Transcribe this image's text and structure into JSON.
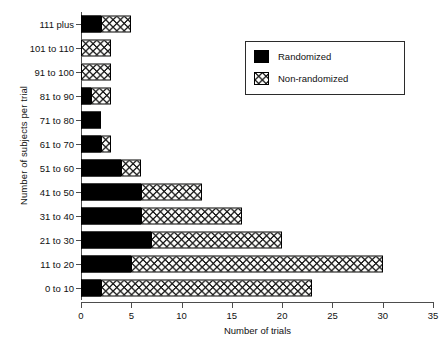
{
  "chart_data": {
    "type": "bar",
    "orientation": "horizontal",
    "stacked": true,
    "title": "",
    "xlabel": "Number of trials",
    "ylabel": "Number of subjects per trial",
    "xlim": [
      0,
      35
    ],
    "xticks": [
      0,
      5,
      10,
      15,
      20,
      25,
      30,
      35
    ],
    "xticklabels": [
      "0",
      "5",
      "10",
      "15",
      "20",
      "25",
      "30",
      "35"
    ],
    "grid": false,
    "legend_position": "upper right",
    "categories": [
      "111 plus",
      "101 to 110",
      "91 to 100",
      "81 to 90",
      "71 to 80",
      "61 to 70",
      "51 to 60",
      "41 to 50",
      "31 to 40",
      "21 to 30",
      "11 to 20",
      "0 to 10"
    ],
    "series": [
      {
        "name": "Randomized",
        "color": "#000000",
        "pattern": "solid",
        "values": [
          2,
          0,
          0,
          1,
          2,
          2,
          4,
          6,
          6,
          7,
          5,
          2
        ]
      },
      {
        "name": "Non-randomized",
        "color": "#ffffff",
        "pattern": "cross-hatch",
        "values": [
          3,
          3,
          3,
          2,
          0,
          1,
          2,
          6,
          10,
          13,
          25,
          21
        ]
      }
    ],
    "totals": [
      5,
      3,
      3,
      3,
      2,
      3,
      6,
      12,
      16,
      20,
      30,
      23
    ]
  },
  "legend": {
    "items": [
      {
        "label": "Randomized",
        "swatch": "solid-black-swatch"
      },
      {
        "label": "Non-randomized",
        "swatch": "cross-hatch-swatch"
      }
    ]
  }
}
